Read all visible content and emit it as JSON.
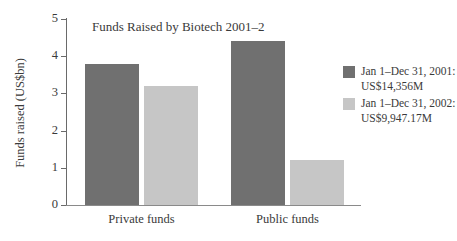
{
  "chart_data": {
    "type": "bar",
    "title": "Funds Raised by Biotech 2001–2",
    "xlabel": "",
    "ylabel": "Funds raised (US$bn)",
    "categories": [
      "Private funds",
      "Public funds"
    ],
    "series": [
      {
        "name": "Jan 1–Dec 31, 2001: US$14,356M",
        "name_line1": "Jan 1–Dec 31, 2001:",
        "name_line2": "US$14,356M",
        "color": "#707070",
        "values": [
          3.8,
          4.4
        ]
      },
      {
        "name": "Jan 1–Dec 31, 2002: US$9,947.17M",
        "name_line1": "Jan 1–Dec 31, 2002:",
        "name_line2": "US$9,947.17M",
        "color": "#c6c6c6",
        "values": [
          3.2,
          1.2
        ]
      }
    ],
    "yticks": [
      "0",
      "1",
      "2",
      "3",
      "4",
      "5"
    ],
    "ylim": [
      0,
      5
    ],
    "grid": false,
    "legend_position": "right"
  }
}
